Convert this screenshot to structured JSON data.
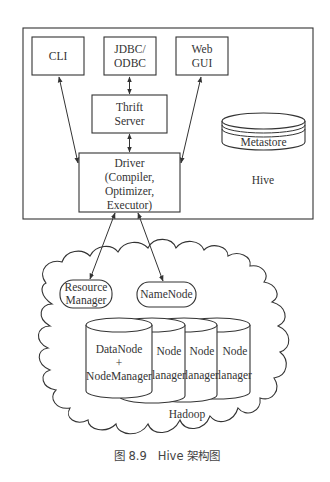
{
  "diagram": {
    "hive": {
      "label": "Hive",
      "components": {
        "cli": {
          "lines": [
            "CLI"
          ]
        },
        "jdbc": {
          "lines": [
            "JDBC/",
            "ODBC"
          ]
        },
        "webgui": {
          "lines": [
            "Web",
            "GUI"
          ]
        },
        "thrift": {
          "lines": [
            "Thrift",
            "Server"
          ]
        },
        "driver": {
          "lines": [
            "Driver",
            "(Compiler,",
            "Optimizer,",
            "Executor)"
          ]
        },
        "metastore": {
          "label": "Metastore"
        }
      }
    },
    "hadoop": {
      "label": "Hadoop",
      "resource_manager": {
        "lines": [
          "Resource",
          "Manager"
        ]
      },
      "namenode": {
        "label": "NameNode"
      },
      "datanodes": [
        {
          "lines": [
            "DataNode",
            "+",
            "NodeManager"
          ]
        },
        {
          "lines": [
            "Node",
            "+",
            "lanager"
          ]
        },
        {
          "lines": [
            "Node",
            "+",
            "lanager"
          ]
        },
        {
          "lines": [
            "Node",
            "+",
            "lanager"
          ]
        }
      ]
    },
    "edges": [
      {
        "from": "CLI",
        "to": "Driver",
        "type": "bidirectional"
      },
      {
        "from": "JDBC/ODBC",
        "to": "Thrift Server",
        "type": "bidirectional"
      },
      {
        "from": "Thrift Server",
        "to": "Driver",
        "type": "bidirectional"
      },
      {
        "from": "Web GUI",
        "to": "Driver",
        "type": "bidirectional"
      },
      {
        "from": "Driver",
        "to": "Resource Manager",
        "type": "bidirectional"
      },
      {
        "from": "Driver",
        "to": "NameNode",
        "type": "bidirectional"
      }
    ]
  },
  "caption": "图 8.9　Hive 架构图"
}
